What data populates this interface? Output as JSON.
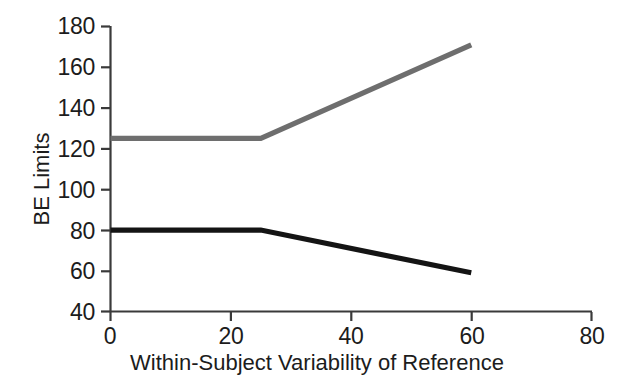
{
  "chart_data": {
    "type": "line",
    "title": "",
    "xlabel": "Within-Subject Variability of Reference",
    "ylabel": "BE Limits",
    "xlim": [
      0,
      80
    ],
    "ylim": [
      40,
      180
    ],
    "xticks": [
      0,
      20,
      40,
      60,
      80
    ],
    "yticks": [
      40,
      60,
      80,
      100,
      120,
      140,
      160,
      180
    ],
    "xtick_labels": [
      "0",
      "20",
      "40",
      "60",
      "80"
    ],
    "ytick_labels": [
      "40",
      "60",
      "80",
      "100",
      "120",
      "140",
      "160",
      "180"
    ],
    "grid": false,
    "legend": "none",
    "series": [
      {
        "name": "Upper BE Limit",
        "color": "#6e6e6e",
        "x": [
          0,
          25,
          60
        ],
        "values": [
          125,
          125,
          171
        ]
      },
      {
        "name": "Lower BE Limit",
        "color": "#141414",
        "x": [
          0,
          25,
          60
        ],
        "values": [
          80,
          80,
          59
        ]
      }
    ]
  },
  "axis": {
    "color": "#3a3a3a"
  }
}
